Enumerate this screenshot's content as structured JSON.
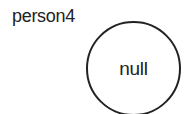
{
  "diagram": {
    "variable_label": "person4",
    "node": {
      "value": "null",
      "shape": "circle"
    }
  }
}
